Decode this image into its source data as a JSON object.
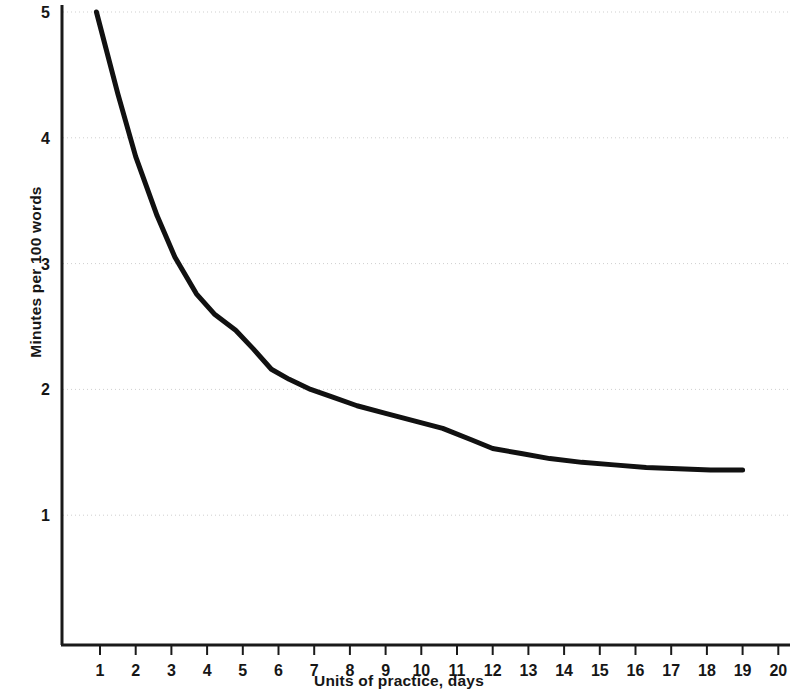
{
  "chart_data": {
    "type": "line",
    "title": "",
    "subtitle": "",
    "xlabel": "Units of practice, days",
    "ylabel": "Minutes per 100 words",
    "xlim": [
      0,
      20.6
    ],
    "ylim": [
      0.55,
      5.0
    ],
    "xticks": [
      1,
      2,
      3,
      4,
      5,
      6,
      7,
      8,
      9,
      10,
      11,
      12,
      13,
      14,
      15,
      16,
      17,
      18,
      19,
      20
    ],
    "xtick_labels": [
      "1",
      "2",
      "3",
      "4",
      "5",
      "6",
      "7",
      "8",
      "9",
      "10",
      "11",
      "12",
      "13",
      "14",
      "15",
      "16",
      "17",
      "18",
      "19",
      "20"
    ],
    "yticks": [
      1,
      2,
      3,
      4,
      5
    ],
    "ytick_labels": [
      "1",
      "2",
      "3",
      "4",
      "5"
    ],
    "grid": "horizontal-dotted",
    "legend": "none",
    "annotations": [],
    "line_color": "#111111",
    "line_width": 5,
    "axis_color": "#1a1a1a",
    "grid_color": "#cfcfcf",
    "background_color": "#ffffff",
    "series": [
      {
        "name": "Minutes per 100 words",
        "x": [
          0.9,
          1.5,
          2.0,
          2.6,
          3.1,
          3.7,
          4.2,
          4.8,
          5.3,
          5.8,
          6.3,
          6.9,
          7.5,
          8.2,
          9.0,
          9.8,
          10.6,
          11.4,
          12.0,
          12.8,
          13.6,
          14.5,
          15.4,
          16.3,
          17.2,
          18.1,
          19.0
        ],
        "y": [
          5.0,
          4.35,
          3.85,
          3.38,
          3.05,
          2.76,
          2.6,
          2.47,
          2.32,
          2.16,
          2.08,
          2.0,
          1.94,
          1.87,
          1.81,
          1.75,
          1.69,
          1.6,
          1.53,
          1.49,
          1.45,
          1.42,
          1.4,
          1.38,
          1.37,
          1.36,
          1.36
        ]
      }
    ]
  },
  "axes": {
    "y_axis_name": "minutes-per-100-words-axis",
    "x_axis_name": "units-of-practice-axis"
  }
}
